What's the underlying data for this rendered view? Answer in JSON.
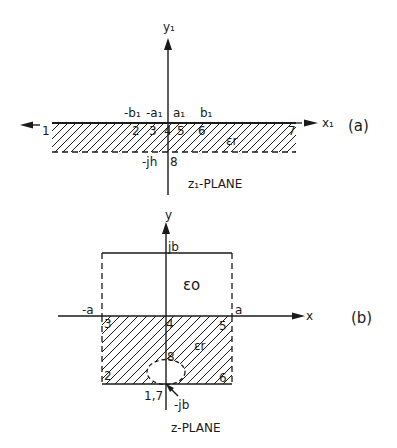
{
  "figure_a": {
    "caption": "(a)",
    "plane_label": "z₁-PLANE",
    "y_axis_label": "y₁",
    "x_axis_label": "x₁",
    "top_labels": [
      "-b₁",
      "-a₁",
      "a₁",
      "b₁"
    ],
    "point_labels": [
      "1",
      "2",
      "3",
      "4",
      "5",
      "6",
      "7"
    ],
    "bottom_point_label": "8",
    "depth_label": "-jh",
    "region_label": "εr"
  },
  "figure_b": {
    "caption": "(b)",
    "plane_label": "z-PLANE",
    "y_axis_label": "y",
    "x_axis_label": "x",
    "top_label": "jb",
    "left_label": "-a",
    "right_label": "a",
    "upper_region_label": "εo",
    "lower_region_label": "εr",
    "point_labels": [
      "3",
      "4",
      "5",
      "2",
      "6",
      "8"
    ],
    "bottom_point_label": "1,7",
    "bottom_coord_label": "-jb"
  }
}
